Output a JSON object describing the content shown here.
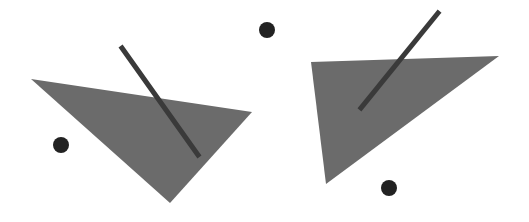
{
  "canvas": {
    "width": 529,
    "height": 222,
    "background": "#ffffff"
  },
  "colors": {
    "triangle_fill": "#6b6b6b",
    "stick_stroke": "#3a3a3a",
    "dot_fill": "#222222"
  },
  "left_figure": {
    "triangle": {
      "points": [
        [
          31,
          79
        ],
        [
          252,
          112
        ],
        [
          170,
          203
        ]
      ]
    },
    "stick": {
      "x1": 122,
      "y1": 48,
      "x2": 198,
      "y2": 155,
      "width": 5
    },
    "dot": {
      "cx": 61,
      "cy": 145,
      "r": 8
    }
  },
  "right_figure": {
    "triangle": {
      "points": [
        [
          311,
          62
        ],
        [
          499,
          56
        ],
        [
          326,
          184
        ]
      ]
    },
    "stick": {
      "x1": 438,
      "y1": 13,
      "x2": 361,
      "y2": 108,
      "width": 5
    },
    "dot": {
      "cx": 389,
      "cy": 188,
      "r": 8
    }
  },
  "top_dot": {
    "cx": 267,
    "cy": 30,
    "r": 8
  }
}
